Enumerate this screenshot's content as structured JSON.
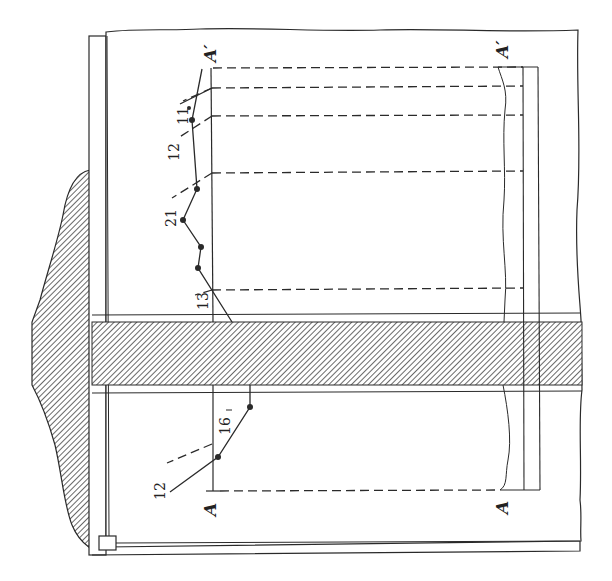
{
  "diagram": {
    "type": "engineering cross-section sketch",
    "colors": {
      "ink": "#2a2a2a",
      "paper": "#ffffff",
      "hatch": "#444444"
    },
    "section_labels": {
      "top_start": "A",
      "top_end": "A′",
      "bottom_start": "A",
      "bottom_end": "A′"
    },
    "profile_left": {
      "labels": [
        {
          "id": "l1",
          "text": "12"
        },
        {
          "id": "l2",
          "text": "16"
        }
      ]
    },
    "profile_right": {
      "labels": [
        {
          "id": "r1",
          "text": "13"
        },
        {
          "id": "r2",
          "text": "21"
        },
        {
          "id": "r3",
          "text": "12"
        },
        {
          "id": "r4",
          "text": "11"
        }
      ]
    }
  }
}
